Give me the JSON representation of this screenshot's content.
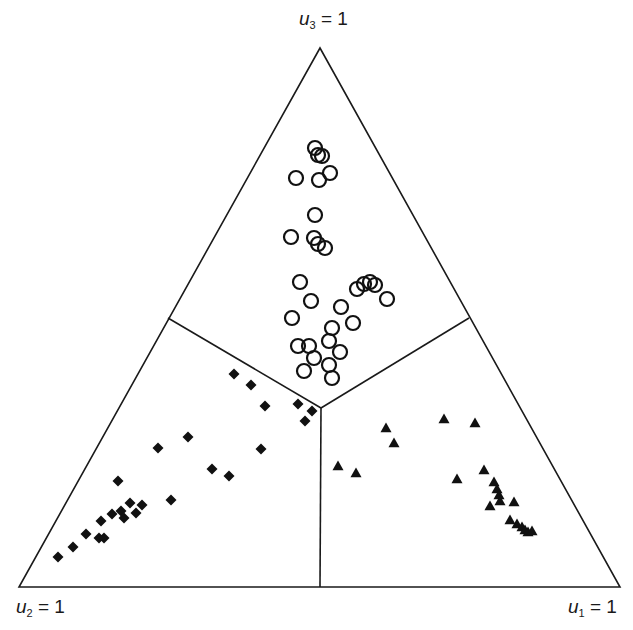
{
  "chart_data": {
    "type": "scatter",
    "subtype": "ternary",
    "title": "",
    "vertices": {
      "top": {
        "label_var": "u",
        "label_sub": "3",
        "label_eq": " = 1"
      },
      "bottom_left": {
        "label_var": "u",
        "label_sub": "2",
        "label_eq": " = 1"
      },
      "bottom_right": {
        "label_var": "u",
        "label_sub": "1",
        "label_eq": " = 1"
      }
    },
    "regions": "three decision regions separated by lines from centroid to edge midpoints",
    "legend": [],
    "grid": false,
    "series": [
      {
        "name": "class-3 (open circles, near u3)",
        "marker": "open-circle",
        "color": "#111111",
        "points_px": [
          [
            315,
            148
          ],
          [
            318,
            155
          ],
          [
            322,
            156
          ],
          [
            330,
            173
          ],
          [
            296,
            178
          ],
          [
            319,
            180
          ],
          [
            315,
            215
          ],
          [
            291,
            237
          ],
          [
            314,
            238
          ],
          [
            318,
            244
          ],
          [
            325,
            248
          ],
          [
            300,
            282
          ],
          [
            357,
            289
          ],
          [
            364,
            284
          ],
          [
            370,
            282
          ],
          [
            375,
            285
          ],
          [
            387,
            299
          ],
          [
            311,
            301
          ],
          [
            341,
            307
          ],
          [
            292,
            318
          ],
          [
            353,
            323
          ],
          [
            332,
            328
          ],
          [
            329,
            341
          ],
          [
            298,
            346
          ],
          [
            309,
            346
          ],
          [
            340,
            352
          ],
          [
            314,
            358
          ],
          [
            329,
            365
          ],
          [
            304,
            371
          ],
          [
            332,
            378
          ]
        ]
      },
      {
        "name": "class-2 (filled diamonds, near u2)",
        "marker": "filled-diamond",
        "color": "#111111",
        "points_px": [
          [
            234,
            374
          ],
          [
            251,
            385
          ],
          [
            265,
            406
          ],
          [
            298,
            404
          ],
          [
            312,
            411
          ],
          [
            305,
            421
          ],
          [
            188,
            437
          ],
          [
            158,
            448
          ],
          [
            261,
            449
          ],
          [
            212,
            469
          ],
          [
            229,
            476
          ],
          [
            118,
            481
          ],
          [
            171,
            500
          ],
          [
            142,
            505
          ],
          [
            130,
            503
          ],
          [
            121,
            511
          ],
          [
            112,
            514
          ],
          [
            124,
            518
          ],
          [
            136,
            513
          ],
          [
            101,
            521
          ],
          [
            86,
            534
          ],
          [
            99,
            538
          ],
          [
            104,
            538
          ],
          [
            73,
            547
          ],
          [
            58,
            557
          ]
        ]
      },
      {
        "name": "class-1 (filled triangles, near u1)",
        "marker": "filled-triangle",
        "color": "#111111",
        "points_px": [
          [
            444,
            419
          ],
          [
            475,
            423
          ],
          [
            386,
            428
          ],
          [
            394,
            443
          ],
          [
            338,
            466
          ],
          [
            356,
            473
          ],
          [
            484,
            470
          ],
          [
            457,
            479
          ],
          [
            494,
            482
          ],
          [
            497,
            489
          ],
          [
            499,
            495
          ],
          [
            500,
            501
          ],
          [
            514,
            502
          ],
          [
            490,
            506
          ],
          [
            510,
            520
          ],
          [
            517,
            524
          ],
          [
            522,
            527
          ],
          [
            525,
            530
          ],
          [
            528,
            532
          ],
          [
            532,
            531
          ]
        ]
      }
    ],
    "geometry_px": {
      "apex": [
        320,
        48
      ],
      "bottom_left": [
        19,
        587
      ],
      "bottom_right": [
        620,
        587
      ],
      "center": [
        321,
        408
      ],
      "divider_left_end": [
        168,
        318
      ],
      "divider_right_end": [
        469,
        318
      ],
      "divider_bottom_end": [
        320,
        587
      ]
    }
  }
}
